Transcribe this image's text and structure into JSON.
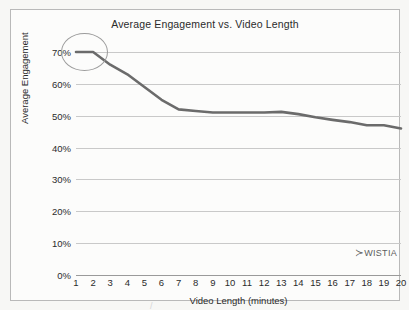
{
  "chart_data": {
    "type": "line",
    "title": "Average Engagement vs. Video Length",
    "xlabel": "Video Length (minutes)",
    "ylabel": "Average Engagement",
    "x": [
      1,
      2,
      3,
      4,
      5,
      6,
      7,
      8,
      9,
      10,
      11,
      12,
      13,
      14,
      15,
      16,
      17,
      18,
      19,
      20
    ],
    "values": [
      70,
      70,
      66,
      63,
      59,
      55,
      52,
      51.5,
      51,
      51,
      51,
      51,
      51.2,
      50.5,
      49.5,
      48.7,
      48,
      47,
      47,
      46
    ],
    "series": [
      {
        "name": "Average Engagement",
        "values": [
          70,
          70,
          66,
          63,
          59,
          55,
          52,
          51.5,
          51,
          51,
          51,
          51,
          51.2,
          50.5,
          49.5,
          48.7,
          48,
          47,
          47,
          46
        ],
        "color": "#6b6b6b"
      }
    ],
    "xlim": [
      1,
      20
    ],
    "ylim": [
      0,
      70
    ],
    "xtick_labels": [
      "1",
      "2",
      "3",
      "4",
      "5",
      "6",
      "7",
      "8",
      "9",
      "10",
      "11",
      "12",
      "13",
      "14",
      "15",
      "16",
      "17",
      "18",
      "19",
      "20"
    ],
    "ytick_values": [
      0,
      10,
      20,
      30,
      40,
      50,
      60,
      70
    ],
    "ytick_labels": [
      "0%",
      "10%",
      "20%",
      "30%",
      "40%",
      "50%",
      "60%",
      "70%"
    ],
    "grid": true,
    "grid_axis": "y",
    "legend": false,
    "legend_position": "none",
    "annotations": [
      {
        "type": "ellipse",
        "name": "highlight-ellipse",
        "x_range": [
          1,
          2
        ],
        "y_center": 70,
        "color": "#9c9c9c"
      }
    ],
    "colors": {
      "line": "#6b6b6b",
      "gridline": "#c9c9c9",
      "axis": "#9a9a9a",
      "text": "#2b2b2b",
      "frame": "#b9b9b9",
      "background": "#fcfcfb",
      "annotation": "#9c9c9c",
      "watermark": "#5d5d5d"
    }
  },
  "watermark": {
    "logo_glyph": "≻",
    "text": "WISTIA"
  },
  "artifacts": {
    "scan_mark": "/"
  }
}
